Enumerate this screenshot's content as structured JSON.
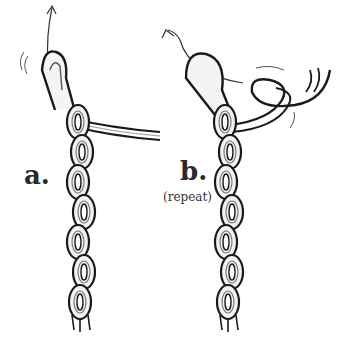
{
  "diagram": {
    "type": "illustration",
    "steps": [
      {
        "id": "a",
        "label": "a.",
        "note": ""
      },
      {
        "id": "b",
        "label": "b.",
        "note": "(repeat)"
      }
    ],
    "colors": {
      "ink": "#1a1a1a",
      "rope_fill": "#f4f4f4",
      "shade": "#9a9a9a",
      "background": "#ffffff"
    }
  }
}
